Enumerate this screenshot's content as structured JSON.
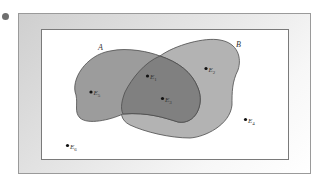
{
  "diagram": {
    "type": "venn",
    "sets": [
      {
        "name": "A",
        "label": "A",
        "color": "#9a9a9a"
      },
      {
        "name": "B",
        "label": "B",
        "color": "#b2b2b2"
      }
    ],
    "intersection_color": "#7e7e7e",
    "outcomes": [
      {
        "id": "E1",
        "label": "E",
        "sub": "1",
        "region": "A∩B"
      },
      {
        "id": "E2",
        "label": "E",
        "sub": "2",
        "region": "B only"
      },
      {
        "id": "E3",
        "label": "E",
        "sub": "3",
        "region": "A∩B"
      },
      {
        "id": "E4",
        "label": "E",
        "sub": "4",
        "region": "outside"
      },
      {
        "id": "E5",
        "label": "E",
        "sub": "5",
        "region": "A only"
      },
      {
        "id": "E6",
        "label": "E",
        "sub": "6",
        "region": "outside"
      }
    ]
  }
}
